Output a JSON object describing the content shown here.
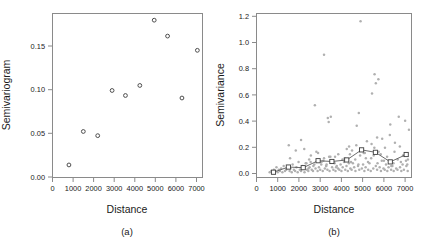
{
  "figure": {
    "panels": [
      {
        "id": "a",
        "caption": "(a)",
        "xlabel": "Distance",
        "ylabel": "Semivariogram"
      },
      {
        "id": "b",
        "caption": "(b)",
        "xlabel": "Distance",
        "ylabel": "Semivariance"
      }
    ]
  },
  "chart_data": [
    {
      "type": "scatter",
      "panel": "a",
      "title": "",
      "xlabel": "Distance",
      "ylabel": "Semivariogram",
      "xlim": [
        0,
        7300
      ],
      "ylim": [
        -0.004,
        0.192
      ],
      "xticks": [
        0,
        1000,
        2000,
        3000,
        4000,
        5000,
        6000,
        7000
      ],
      "xticklabels": [
        "0",
        "1000",
        "2000",
        "3000",
        "4000",
        "5000",
        "6000",
        "7000"
      ],
      "yticks": [
        0.0,
        0.05,
        0.1,
        0.15
      ],
      "yticklabels": [
        "0.00",
        "0.05",
        "0.10",
        "0.15"
      ],
      "grid": false,
      "legend": false,
      "marker": "open-circle",
      "x": [
        800,
        1500,
        2200,
        2900,
        3550,
        4250,
        4950,
        5600,
        6300,
        7050
      ],
      "y": [
        0.011,
        0.051,
        0.046,
        0.1,
        0.094,
        0.106,
        0.184,
        0.165,
        0.091,
        0.148
      ]
    },
    {
      "type": "scatter",
      "panel": "b",
      "title": "",
      "xlabel": "Distance",
      "ylabel": "Semivariance",
      "xlim": [
        0,
        7300
      ],
      "ylim": [
        -0.03,
        1.24
      ],
      "xticks": [
        0,
        1000,
        2000,
        3000,
        4000,
        5000,
        6000,
        7000
      ],
      "xticklabels": [
        "0",
        "1000",
        "2000",
        "3000",
        "4000",
        "5000",
        "6000",
        "7000"
      ],
      "yticks": [
        0.0,
        0.2,
        0.4,
        0.6,
        0.8,
        1.0,
        1.2
      ],
      "yticklabels": [
        "0.0",
        "0.2",
        "0.4",
        "0.6",
        "0.8",
        "1.0",
        "1.2"
      ],
      "grid": false,
      "legend": false,
      "series": [
        {
          "name": "semivariance cloud",
          "marker": "filled-circle",
          "color": "#b0b0b0",
          "x": [
            620,
            700,
            760,
            820,
            880,
            940,
            1000,
            1050,
            1100,
            1160,
            1220,
            1280,
            1340,
            1400,
            1460,
            1520,
            1560,
            1600,
            1660,
            1700,
            1760,
            1820,
            1880,
            1940,
            1980,
            2040,
            2100,
            2160,
            2200,
            2260,
            2320,
            2380,
            2440,
            2500,
            2560,
            2600,
            2660,
            2720,
            2780,
            2820,
            2880,
            2940,
            3000,
            3060,
            3120,
            3180,
            3220,
            3280,
            3340,
            3400,
            3440,
            3500,
            3560,
            3620,
            3680,
            3720,
            3780,
            3840,
            3900,
            3960,
            4000,
            4060,
            4120,
            4180,
            4240,
            4300,
            4360,
            4420,
            4480,
            4540,
            4600,
            4660,
            4720,
            4780,
            4840,
            4900,
            4960,
            5020,
            5080,
            5140,
            5200,
            5260,
            5320,
            5380,
            5440,
            5500,
            5560,
            5620,
            5680,
            5740,
            5800,
            5860,
            5920,
            5980,
            6040,
            6100,
            6160,
            6220,
            6280,
            6340,
            6400,
            6460,
            6520,
            6580,
            6640,
            6700,
            6760,
            6820,
            6880,
            6940,
            7000,
            7060,
            7120,
            7180,
            1580,
            2250,
            2350,
            2480,
            2680,
            2900,
            3150,
            3300,
            3480,
            3600,
            3750,
            3850,
            4150,
            4350,
            4500,
            4650,
            4800,
            4880,
            5100,
            5250,
            5400,
            5550,
            5700,
            5850,
            6000,
            6150,
            6350,
            6500,
            6650,
            6800,
            6950,
            7100,
            3180,
            4820,
            5620,
            5680,
            4700,
            5520,
            5420,
            4450,
            3420,
            3360,
            6300,
            7130,
            6750,
            5900,
            5050,
            4250,
            2100,
            2550,
            3050,
            3700,
            4050,
            4400,
            5150,
            5750,
            6050,
            6450,
            6900,
            7040,
            2750,
            3280,
            1850,
            2450
          ],
          "y": [
            0.01,
            0.02,
            0.01,
            0.03,
            0.02,
            0.05,
            0.01,
            0.03,
            0.02,
            0.04,
            0.01,
            0.06,
            0.02,
            0.03,
            0.05,
            0.22,
            0.02,
            0.04,
            0.01,
            0.07,
            0.03,
            0.02,
            0.05,
            0.01,
            0.09,
            0.03,
            0.02,
            0.06,
            0.04,
            0.01,
            0.08,
            0.03,
            0.02,
            0.05,
            0.14,
            0.03,
            0.02,
            0.07,
            0.04,
            0.17,
            0.02,
            0.05,
            0.03,
            0.09,
            0.02,
            0.92,
            0.04,
            0.06,
            0.03,
            0.4,
            0.02,
            0.44,
            0.05,
            0.03,
            0.08,
            0.02,
            0.06,
            0.04,
            0.03,
            0.07,
            0.02,
            0.05,
            0.09,
            0.03,
            0.06,
            0.02,
            0.21,
            0.04,
            0.03,
            0.08,
            0.05,
            0.02,
            0.37,
            0.06,
            0.03,
            1.18,
            0.04,
            0.07,
            0.02,
            0.05,
            0.25,
            0.03,
            0.08,
            0.02,
            0.62,
            0.04,
            0.77,
            0.06,
            0.03,
            0.73,
            0.05,
            0.02,
            0.27,
            0.04,
            0.03,
            0.07,
            0.02,
            0.05,
            0.3,
            0.03,
            0.06,
            0.02,
            0.24,
            0.04,
            0.03,
            0.44,
            0.05,
            0.02,
            0.07,
            0.03,
            0.41,
            0.06,
            0.02,
            0.34,
            0.12,
            0.19,
            0.08,
            0.11,
            0.06,
            0.16,
            0.1,
            0.07,
            0.13,
            0.09,
            0.05,
            0.15,
            0.12,
            0.08,
            0.18,
            0.11,
            0.07,
            0.14,
            0.16,
            0.09,
            0.12,
            0.2,
            0.08,
            0.15,
            0.1,
            0.13,
            0.06,
            0.17,
            0.11,
            0.09,
            0.14,
            0.07,
            0.12,
            0.47,
            0.7,
            0.28,
            0.22,
            0.14,
            0.23,
            0.09,
            0.13,
            0.43,
            0.38,
            0.11,
            0.21,
            0.1,
            0.16,
            0.19,
            0.26,
            0.09,
            0.07,
            0.13,
            0.11,
            0.15,
            0.12,
            0.17,
            0.2,
            0.08,
            0.14,
            0.1,
            0.53,
            0.06,
            0.18,
            0.04,
            0.1
          ]
        },
        {
          "name": "binned mean semivariance",
          "marker": "open-square-line",
          "color": "#3d3d3d",
          "x": [
            800,
            1500,
            2200,
            2900,
            3550,
            4250,
            4950,
            5600,
            6300,
            7050
          ],
          "y": [
            0.011,
            0.051,
            0.046,
            0.1,
            0.094,
            0.106,
            0.184,
            0.165,
            0.091,
            0.148
          ]
        }
      ]
    }
  ]
}
